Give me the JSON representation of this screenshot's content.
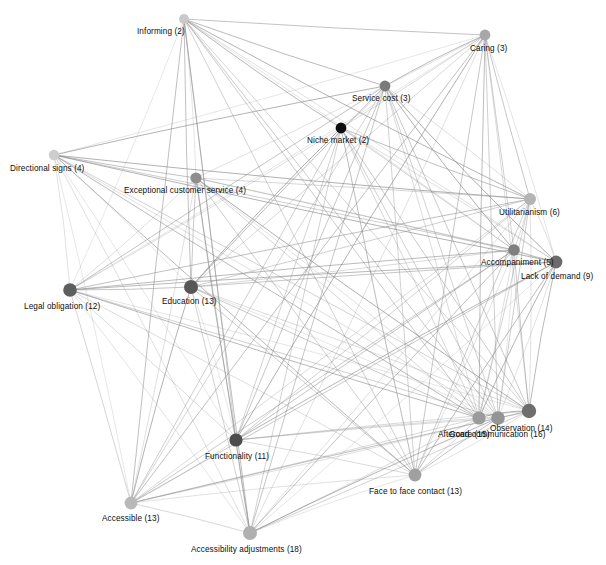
{
  "figure": {
    "type": "network-graph",
    "background_color": "#ffffff",
    "edge_color": "#8c8c8c",
    "width": 606,
    "height": 565
  },
  "chart_data": {
    "type": "scatter",
    "title": "",
    "xlabel": "",
    "ylabel": "",
    "grid": false,
    "legend_position": "none",
    "nodes": [
      {
        "id": "informing",
        "label": "Informing (2)",
        "count": 2,
        "x": 184,
        "y": 19,
        "r": 5.0,
        "color": "#c9c9c9",
        "label_x": 137,
        "label_y": 27
      },
      {
        "id": "caring",
        "label": "Caring (3)",
        "count": 3,
        "x": 485,
        "y": 35,
        "r": 5.4,
        "color": "#a8a8a8",
        "label_x": 470,
        "label_y": 44
      },
      {
        "id": "service_cost",
        "label": "Service cost (3)",
        "count": 3,
        "x": 385,
        "y": 86,
        "r": 5.4,
        "color": "#7a7a7a",
        "label_x": 352,
        "label_y": 94
      },
      {
        "id": "niche_market",
        "label": "Niche market (2)",
        "count": 2,
        "x": 341,
        "y": 128,
        "r": 5.4,
        "color": "#0d0d0d",
        "label_x": 307,
        "label_y": 136
      },
      {
        "id": "directional_signs",
        "label": "Directional signs (4)",
        "count": 4,
        "x": 54,
        "y": 155,
        "r": 5.2,
        "color": "#cdcdcd",
        "label_x": 10,
        "label_y": 164
      },
      {
        "id": "exceptional_customer_service",
        "label": "Exceptional customer service (4)",
        "count": 4,
        "x": 196,
        "y": 178,
        "r": 5.6,
        "color": "#8e8e8e",
        "label_x": 124,
        "label_y": 186
      },
      {
        "id": "utilitarianism",
        "label": "Utilitarianism (6)",
        "count": 6,
        "x": 530,
        "y": 199,
        "r": 6.0,
        "color": "#b4b4b4",
        "label_x": 499,
        "label_y": 208
      },
      {
        "id": "accompaniment",
        "label": "Accompaniment (5)",
        "count": 5,
        "x": 514,
        "y": 250,
        "r": 5.8,
        "color": "#7f7f7f",
        "label_x": 481,
        "label_y": 258
      },
      {
        "id": "lack_of_demand",
        "label": "Lack of demand (9)",
        "count": 9,
        "x": 556,
        "y": 262,
        "r": 6.4,
        "color": "#6b6b6b",
        "label_x": 521,
        "label_y": 272
      },
      {
        "id": "legal_obligation",
        "label": "Legal obligation (12)",
        "count": 12,
        "x": 70,
        "y": 290,
        "r": 6.8,
        "color": "#5e5e5e",
        "label_x": 24,
        "label_y": 302
      },
      {
        "id": "education",
        "label": "Education (13)",
        "count": 13,
        "x": 191,
        "y": 287,
        "r": 7.0,
        "color": "#575757",
        "label_x": 162,
        "label_y": 297
      },
      {
        "id": "observation",
        "label": "Observation (14)",
        "count": 14,
        "x": 529,
        "y": 411,
        "r": 7.2,
        "color": "#6e6e6e",
        "label_x": 490,
        "label_y": 424
      },
      {
        "id": "aftercare",
        "label": "Aftercare (15)",
        "count": 15,
        "x": 479,
        "y": 418,
        "r": 6.6,
        "color": "#9b9b9b",
        "label_x": 438,
        "label_y": 430
      },
      {
        "id": "good_communication",
        "label": "Good communication (16)",
        "count": 16,
        "x": 498,
        "y": 418,
        "r": 6.8,
        "color": "#949494",
        "label_x": 449,
        "label_y": 430
      },
      {
        "id": "functionality",
        "label": "Functionality (11)",
        "count": 11,
        "x": 236,
        "y": 440,
        "r": 6.6,
        "color": "#4d4d4d",
        "label_x": 205,
        "label_y": 452
      },
      {
        "id": "face_to_face_contact",
        "label": "Face to face contact (13)",
        "count": 13,
        "x": 415,
        "y": 475,
        "r": 6.4,
        "color": "#a0a0a0",
        "label_x": 369,
        "label_y": 487
      },
      {
        "id": "accessible",
        "label": "Accessible (13)",
        "count": 13,
        "x": 131,
        "y": 503,
        "r": 6.4,
        "color": "#b8b8b8",
        "label_x": 102,
        "label_y": 514
      },
      {
        "id": "accessibility_adjustments",
        "label": "Accessibility adjustments (18)",
        "count": 18,
        "x": 250,
        "y": 533,
        "r": 7.0,
        "color": "#b0b0b0",
        "label_x": 191,
        "label_y": 545
      }
    ],
    "edges": [
      [
        "informing",
        "caring"
      ],
      [
        "informing",
        "service_cost"
      ],
      [
        "informing",
        "niche_market"
      ],
      [
        "informing",
        "utilitarianism"
      ],
      [
        "informing",
        "accompaniment"
      ],
      [
        "informing",
        "lack_of_demand"
      ],
      [
        "informing",
        "education"
      ],
      [
        "informing",
        "functionality"
      ],
      [
        "informing",
        "observation"
      ],
      [
        "informing",
        "aftercare"
      ],
      [
        "informing",
        "good_communication"
      ],
      [
        "informing",
        "accessible"
      ],
      [
        "informing",
        "accessibility_adjustments"
      ],
      [
        "informing",
        "face_to_face_contact"
      ],
      [
        "informing",
        "exceptional_customer_service"
      ],
      [
        "informing",
        "legal_obligation"
      ],
      [
        "caring",
        "service_cost"
      ],
      [
        "caring",
        "niche_market"
      ],
      [
        "caring",
        "utilitarianism"
      ],
      [
        "caring",
        "accompaniment"
      ],
      [
        "caring",
        "lack_of_demand"
      ],
      [
        "caring",
        "education"
      ],
      [
        "caring",
        "legal_obligation"
      ],
      [
        "caring",
        "functionality"
      ],
      [
        "caring",
        "observation"
      ],
      [
        "caring",
        "aftercare"
      ],
      [
        "caring",
        "good_communication"
      ],
      [
        "caring",
        "accessible"
      ],
      [
        "caring",
        "accessibility_adjustments"
      ],
      [
        "caring",
        "face_to_face_contact"
      ],
      [
        "caring",
        "directional_signs"
      ],
      [
        "caring",
        "exceptional_customer_service"
      ],
      [
        "service_cost",
        "niche_market"
      ],
      [
        "service_cost",
        "utilitarianism"
      ],
      [
        "service_cost",
        "accompaniment"
      ],
      [
        "service_cost",
        "lack_of_demand"
      ],
      [
        "service_cost",
        "education"
      ],
      [
        "service_cost",
        "legal_obligation"
      ],
      [
        "service_cost",
        "functionality"
      ],
      [
        "service_cost",
        "observation"
      ],
      [
        "service_cost",
        "aftercare"
      ],
      [
        "service_cost",
        "good_communication"
      ],
      [
        "service_cost",
        "accessible"
      ],
      [
        "service_cost",
        "accessibility_adjustments"
      ],
      [
        "service_cost",
        "face_to_face_contact"
      ],
      [
        "service_cost",
        "directional_signs"
      ],
      [
        "niche_market",
        "utilitarianism"
      ],
      [
        "niche_market",
        "accompaniment"
      ],
      [
        "niche_market",
        "lack_of_demand"
      ],
      [
        "niche_market",
        "education"
      ],
      [
        "niche_market",
        "functionality"
      ],
      [
        "niche_market",
        "observation"
      ],
      [
        "niche_market",
        "aftercare"
      ],
      [
        "niche_market",
        "good_communication"
      ],
      [
        "niche_market",
        "accessible"
      ],
      [
        "niche_market",
        "accessibility_adjustments"
      ],
      [
        "niche_market",
        "face_to_face_contact"
      ],
      [
        "niche_market",
        "legal_obligation"
      ],
      [
        "directional_signs",
        "exceptional_customer_service"
      ],
      [
        "directional_signs",
        "utilitarianism"
      ],
      [
        "directional_signs",
        "accompaniment"
      ],
      [
        "directional_signs",
        "lack_of_demand"
      ],
      [
        "directional_signs",
        "education"
      ],
      [
        "directional_signs",
        "legal_obligation"
      ],
      [
        "directional_signs",
        "functionality"
      ],
      [
        "directional_signs",
        "observation"
      ],
      [
        "directional_signs",
        "aftercare"
      ],
      [
        "directional_signs",
        "good_communication"
      ],
      [
        "directional_signs",
        "accessible"
      ],
      [
        "directional_signs",
        "accessibility_adjustments"
      ],
      [
        "directional_signs",
        "face_to_face_contact"
      ],
      [
        "exceptional_customer_service",
        "utilitarianism"
      ],
      [
        "exceptional_customer_service",
        "accompaniment"
      ],
      [
        "exceptional_customer_service",
        "lack_of_demand"
      ],
      [
        "exceptional_customer_service",
        "education"
      ],
      [
        "exceptional_customer_service",
        "legal_obligation"
      ],
      [
        "exceptional_customer_service",
        "functionality"
      ],
      [
        "exceptional_customer_service",
        "observation"
      ],
      [
        "exceptional_customer_service",
        "aftercare"
      ],
      [
        "exceptional_customer_service",
        "good_communication"
      ],
      [
        "exceptional_customer_service",
        "accessible"
      ],
      [
        "exceptional_customer_service",
        "accessibility_adjustments"
      ],
      [
        "exceptional_customer_service",
        "face_to_face_contact"
      ],
      [
        "utilitarianism",
        "accompaniment"
      ],
      [
        "utilitarianism",
        "lack_of_demand"
      ],
      [
        "utilitarianism",
        "education"
      ],
      [
        "utilitarianism",
        "legal_obligation"
      ],
      [
        "utilitarianism",
        "functionality"
      ],
      [
        "utilitarianism",
        "observation"
      ],
      [
        "utilitarianism",
        "aftercare"
      ],
      [
        "utilitarianism",
        "good_communication"
      ],
      [
        "utilitarianism",
        "accessible"
      ],
      [
        "utilitarianism",
        "accessibility_adjustments"
      ],
      [
        "utilitarianism",
        "face_to_face_contact"
      ],
      [
        "accompaniment",
        "lack_of_demand"
      ],
      [
        "accompaniment",
        "education"
      ],
      [
        "accompaniment",
        "legal_obligation"
      ],
      [
        "accompaniment",
        "functionality"
      ],
      [
        "accompaniment",
        "observation"
      ],
      [
        "accompaniment",
        "aftercare"
      ],
      [
        "accompaniment",
        "good_communication"
      ],
      [
        "accompaniment",
        "accessible"
      ],
      [
        "accompaniment",
        "accessibility_adjustments"
      ],
      [
        "accompaniment",
        "face_to_face_contact"
      ],
      [
        "lack_of_demand",
        "education"
      ],
      [
        "lack_of_demand",
        "legal_obligation"
      ],
      [
        "lack_of_demand",
        "functionality"
      ],
      [
        "lack_of_demand",
        "observation"
      ],
      [
        "lack_of_demand",
        "aftercare"
      ],
      [
        "lack_of_demand",
        "good_communication"
      ],
      [
        "lack_of_demand",
        "accessible"
      ],
      [
        "lack_of_demand",
        "accessibility_adjustments"
      ],
      [
        "lack_of_demand",
        "face_to_face_contact"
      ],
      [
        "legal_obligation",
        "education"
      ],
      [
        "legal_obligation",
        "functionality"
      ],
      [
        "legal_obligation",
        "observation"
      ],
      [
        "legal_obligation",
        "aftercare"
      ],
      [
        "legal_obligation",
        "good_communication"
      ],
      [
        "legal_obligation",
        "accessible"
      ],
      [
        "legal_obligation",
        "accessibility_adjustments"
      ],
      [
        "legal_obligation",
        "face_to_face_contact"
      ],
      [
        "education",
        "functionality"
      ],
      [
        "education",
        "observation"
      ],
      [
        "education",
        "aftercare"
      ],
      [
        "education",
        "good_communication"
      ],
      [
        "education",
        "accessible"
      ],
      [
        "education",
        "accessibility_adjustments"
      ],
      [
        "education",
        "face_to_face_contact"
      ],
      [
        "functionality",
        "observation"
      ],
      [
        "functionality",
        "aftercare"
      ],
      [
        "functionality",
        "good_communication"
      ],
      [
        "functionality",
        "accessible"
      ],
      [
        "functionality",
        "accessibility_adjustments"
      ],
      [
        "functionality",
        "face_to_face_contact"
      ],
      [
        "observation",
        "aftercare"
      ],
      [
        "observation",
        "good_communication"
      ],
      [
        "observation",
        "accessible"
      ],
      [
        "observation",
        "accessibility_adjustments"
      ],
      [
        "observation",
        "face_to_face_contact"
      ],
      [
        "aftercare",
        "good_communication"
      ],
      [
        "aftercare",
        "accessible"
      ],
      [
        "aftercare",
        "accessibility_adjustments"
      ],
      [
        "aftercare",
        "face_to_face_contact"
      ],
      [
        "good_communication",
        "accessible"
      ],
      [
        "good_communication",
        "accessibility_adjustments"
      ],
      [
        "good_communication",
        "face_to_face_contact"
      ],
      [
        "accessible",
        "accessibility_adjustments"
      ],
      [
        "accessible",
        "face_to_face_contact"
      ],
      [
        "accessibility_adjustments",
        "face_to_face_contact"
      ]
    ]
  }
}
